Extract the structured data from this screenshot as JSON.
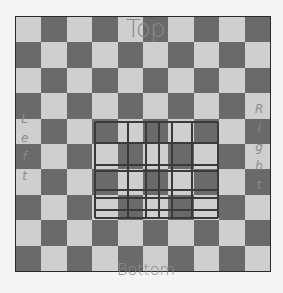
{
  "board": {
    "rows": 10,
    "cols": 10,
    "top_left_color": "light",
    "colors": {
      "light": "#cfcfcf",
      "dark": "#6a6a6a",
      "border": "#2a2a2a"
    }
  },
  "labels": {
    "top": "Top",
    "bottom": "Bottom",
    "left": [
      "L",
      "e",
      "f",
      "t"
    ],
    "right": [
      "R",
      "i",
      "g",
      "h",
      "t"
    ]
  },
  "overlay_grid": {
    "color": "#3a3a3a",
    "x_lines": [
      95,
      128,
      146,
      159,
      172,
      192,
      218
    ],
    "y_lines": [
      122,
      143,
      165,
      171,
      190,
      198,
      210,
      218
    ],
    "x_range": [
      95,
      218
    ],
    "y_range": [
      122,
      218
    ]
  }
}
